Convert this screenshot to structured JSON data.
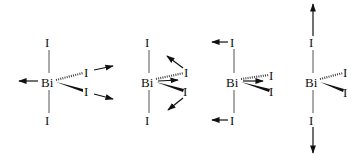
{
  "diagram": {
    "panels": [
      {
        "id": "mode-1",
        "center": "Bi",
        "axial_top": "I",
        "axial_bottom": "I",
        "eq_hashed": "I",
        "eq_wedge": "I"
      },
      {
        "id": "mode-2",
        "center": "Bi",
        "axial_top": "I",
        "axial_bottom": "I",
        "eq_hashed": "I",
        "eq_wedge": "I"
      },
      {
        "id": "mode-3",
        "center": "Bi",
        "axial_top": "I",
        "axial_bottom": "I",
        "eq_hashed": "I",
        "eq_wedge": "I"
      },
      {
        "id": "mode-4",
        "center": "Bi",
        "axial_top": "I",
        "axial_bottom": "I",
        "eq_hashed": "I",
        "eq_wedge": "I"
      }
    ],
    "colors": {
      "bond": "#555555",
      "arrow": "#111111",
      "text": "#111111"
    }
  }
}
